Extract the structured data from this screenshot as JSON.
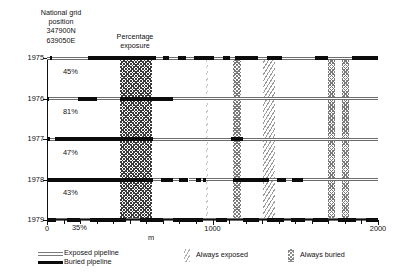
{
  "header": {
    "grid_caption": "National grid\nposition\n347900N\n639050E",
    "pct_caption": "Percentage\nexposure"
  },
  "axis": {
    "x_label": "m",
    "x_ticks": [
      {
        "value": 0,
        "label": "0",
        "major": true
      },
      {
        "value": 100,
        "label": "",
        "major": false
      },
      {
        "value": 200,
        "label": "",
        "major": false
      },
      {
        "value": 300,
        "label": "",
        "major": false
      },
      {
        "value": 400,
        "label": "",
        "major": false
      },
      {
        "value": 500,
        "label": "",
        "major": false
      },
      {
        "value": 600,
        "label": "",
        "major": false
      },
      {
        "value": 700,
        "label": "",
        "major": false
      },
      {
        "value": 800,
        "label": "",
        "major": false
      },
      {
        "value": 900,
        "label": "",
        "major": false
      },
      {
        "value": 1000,
        "label": "1000",
        "major": true
      },
      {
        "value": 1100,
        "label": "",
        "major": false
      },
      {
        "value": 1200,
        "label": "",
        "major": false
      },
      {
        "value": 1300,
        "label": "",
        "major": false
      },
      {
        "value": 1400,
        "label": "",
        "major": false
      },
      {
        "value": 1500,
        "label": "",
        "major": false
      },
      {
        "value": 1600,
        "label": "",
        "major": false
      },
      {
        "value": 1700,
        "label": "",
        "major": false
      },
      {
        "value": 1800,
        "label": "",
        "major": false
      },
      {
        "value": 1900,
        "label": "",
        "major": false
      },
      {
        "value": 2000,
        "label": "2000",
        "major": true
      }
    ],
    "xlim": [
      0,
      2000
    ],
    "years": [
      "1975",
      "1976",
      "1977",
      "1978",
      "1979"
    ]
  },
  "legend": {
    "items": [
      {
        "key": "exposed-pipeline",
        "label": "Exposed pipeline",
        "swatch": "line-exposed"
      },
      {
        "key": "buried-pipeline",
        "label": "Buried pipeline",
        "swatch": "line-buried"
      },
      {
        "key": "always-exposed",
        "label": "Always exposed",
        "swatch": "band-always-exposed"
      },
      {
        "key": "always-buried",
        "label": "Always buried",
        "swatch": "band-always-buried"
      }
    ]
  },
  "chart_data": {
    "type": "bar",
    "title": "",
    "subtitle": "National grid position 347900N 639050E",
    "xlabel": "m",
    "ylabel": "",
    "xlim": [
      0,
      2000
    ],
    "grid": false,
    "legend_position": "bottom",
    "categories": [
      "1975",
      "1976",
      "1977",
      "1978",
      "1979"
    ],
    "exposure_percent": [
      45,
      81,
      47,
      43,
      35
    ],
    "vertical_bands": [
      {
        "name": "always buried",
        "type": "always-buried",
        "x0": 440,
        "x1": 635,
        "style": "buried-dark"
      },
      {
        "name": "always exposed",
        "type": "always-exposed",
        "x0": 960,
        "x1": 975,
        "style": "exposed-faint"
      },
      {
        "name": "always buried",
        "type": "always-buried",
        "x0": 1125,
        "x1": 1170,
        "style": "buried-mid"
      },
      {
        "name": "always exposed",
        "type": "always-exposed",
        "x0": 1305,
        "x1": 1375,
        "style": "exposed-light"
      },
      {
        "name": "always buried",
        "type": "always-buried",
        "x0": 1695,
        "x1": 1740,
        "style": "buried-mid"
      },
      {
        "name": "always buried",
        "type": "always-buried",
        "x0": 1785,
        "x1": 1825,
        "style": "buried-mid"
      }
    ],
    "series": [
      {
        "name": "1975",
        "exposure_percent": 45,
        "segments": [
          {
            "state": "exposed",
            "x0": 0,
            "x1": 20
          },
          {
            "state": "buried",
            "x0": 20,
            "x1": 30
          },
          {
            "state": "exposed",
            "x0": 30,
            "x1": 250
          },
          {
            "state": "buried",
            "x0": 250,
            "x1": 660
          },
          {
            "state": "exposed",
            "x0": 660,
            "x1": 700
          },
          {
            "state": "buried",
            "x0": 700,
            "x1": 735
          },
          {
            "state": "exposed",
            "x0": 735,
            "x1": 790
          },
          {
            "state": "buried",
            "x0": 790,
            "x1": 840
          },
          {
            "state": "exposed",
            "x0": 840,
            "x1": 890
          },
          {
            "state": "buried",
            "x0": 890,
            "x1": 1010
          },
          {
            "state": "exposed",
            "x0": 1010,
            "x1": 1065
          },
          {
            "state": "buried",
            "x0": 1065,
            "x1": 1105
          },
          {
            "state": "exposed",
            "x0": 1105,
            "x1": 1135
          },
          {
            "state": "buried",
            "x0": 1135,
            "x1": 1275
          },
          {
            "state": "exposed",
            "x0": 1275,
            "x1": 1330
          },
          {
            "state": "buried",
            "x0": 1330,
            "x1": 1420
          },
          {
            "state": "exposed",
            "x0": 1420,
            "x1": 1620
          },
          {
            "state": "buried",
            "x0": 1620,
            "x1": 1700
          },
          {
            "state": "exposed",
            "x0": 1700,
            "x1": 1840
          },
          {
            "state": "buried",
            "x0": 1840,
            "x1": 2000
          }
        ]
      },
      {
        "name": "1976",
        "exposure_percent": 81,
        "segments": [
          {
            "state": "buried",
            "x0": 0,
            "x1": 15
          },
          {
            "state": "exposed",
            "x0": 15,
            "x1": 185
          },
          {
            "state": "buried",
            "x0": 185,
            "x1": 300
          },
          {
            "state": "exposed",
            "x0": 300,
            "x1": 440
          },
          {
            "state": "buried",
            "x0": 440,
            "x1": 760
          },
          {
            "state": "exposed",
            "x0": 760,
            "x1": 2000
          }
        ]
      },
      {
        "name": "1977",
        "exposure_percent": 47,
        "segments": [
          {
            "state": "buried",
            "x0": 0,
            "x1": 20
          },
          {
            "state": "exposed",
            "x0": 20,
            "x1": 48
          },
          {
            "state": "buried",
            "x0": 48,
            "x1": 640
          },
          {
            "state": "exposed",
            "x0": 640,
            "x1": 1110
          },
          {
            "state": "buried",
            "x0": 1110,
            "x1": 1185
          },
          {
            "state": "exposed",
            "x0": 1185,
            "x1": 2000
          }
        ]
      },
      {
        "name": "1978",
        "exposure_percent": 43,
        "segments": [
          {
            "state": "buried",
            "x0": 0,
            "x1": 640
          },
          {
            "state": "exposed",
            "x0": 640,
            "x1": 690
          },
          {
            "state": "buried",
            "x0": 690,
            "x1": 760
          },
          {
            "state": "exposed",
            "x0": 760,
            "x1": 800
          },
          {
            "state": "buried",
            "x0": 800,
            "x1": 855
          },
          {
            "state": "exposed",
            "x0": 855,
            "x1": 900
          },
          {
            "state": "buried",
            "x0": 900,
            "x1": 930
          },
          {
            "state": "exposed",
            "x0": 930,
            "x1": 945
          },
          {
            "state": "buried",
            "x0": 945,
            "x1": 960
          },
          {
            "state": "exposed",
            "x0": 960,
            "x1": 1125
          },
          {
            "state": "buried",
            "x0": 1125,
            "x1": 1340
          },
          {
            "state": "exposed",
            "x0": 1340,
            "x1": 1390
          },
          {
            "state": "buried",
            "x0": 1390,
            "x1": 1445
          },
          {
            "state": "exposed",
            "x0": 1445,
            "x1": 1480
          },
          {
            "state": "buried",
            "x0": 1480,
            "x1": 1545
          },
          {
            "state": "exposed",
            "x0": 1545,
            "x1": 2000
          }
        ]
      },
      {
        "name": "1979",
        "exposure_percent": 35,
        "segments": [
          {
            "state": "buried",
            "x0": 0,
            "x1": 55
          },
          {
            "state": "exposed",
            "x0": 55,
            "x1": 120
          },
          {
            "state": "buried",
            "x0": 120,
            "x1": 200
          },
          {
            "state": "exposed",
            "x0": 200,
            "x1": 260
          },
          {
            "state": "buried",
            "x0": 260,
            "x1": 480
          },
          {
            "state": "exposed",
            "x0": 480,
            "x1": 560
          },
          {
            "state": "buried",
            "x0": 560,
            "x1": 700
          },
          {
            "state": "exposed",
            "x0": 700,
            "x1": 760
          },
          {
            "state": "buried",
            "x0": 760,
            "x1": 940
          },
          {
            "state": "exposed",
            "x0": 940,
            "x1": 1020
          },
          {
            "state": "buried",
            "x0": 1020,
            "x1": 1090
          },
          {
            "state": "exposed",
            "x0": 1090,
            "x1": 1185
          },
          {
            "state": "buried",
            "x0": 1185,
            "x1": 1280
          },
          {
            "state": "exposed",
            "x0": 1280,
            "x1": 1330
          },
          {
            "state": "buried",
            "x0": 1330,
            "x1": 1430
          },
          {
            "state": "exposed",
            "x0": 1430,
            "x1": 1475
          },
          {
            "state": "buried",
            "x0": 1475,
            "x1": 1560
          },
          {
            "state": "exposed",
            "x0": 1560,
            "x1": 1610
          },
          {
            "state": "buried",
            "x0": 1610,
            "x1": 1700
          },
          {
            "state": "exposed",
            "x0": 1700,
            "x1": 1760
          },
          {
            "state": "buried",
            "x0": 1760,
            "x1": 1870
          },
          {
            "state": "exposed",
            "x0": 1870,
            "x1": 1930
          },
          {
            "state": "buried",
            "x0": 1930,
            "x1": 2000
          }
        ]
      }
    ],
    "percent_labels": [
      {
        "year": "1975",
        "text": "45%"
      },
      {
        "year": "1976",
        "text": "81%"
      },
      {
        "year": "1977",
        "text": "47%"
      },
      {
        "year": "1978",
        "text": "43%"
      },
      {
        "year": "1979",
        "text": "35%"
      }
    ]
  }
}
